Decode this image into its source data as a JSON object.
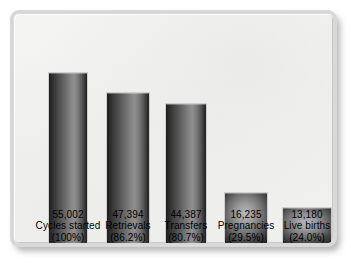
{
  "chart": {
    "type": "bar",
    "title": "",
    "subtitle": "",
    "xlabel": "",
    "ylabel": "",
    "legend": "none",
    "grid": false,
    "axis_visible": false,
    "ylim": [
      0,
      55002
    ],
    "categories": [
      "Cycles started",
      "Retrievals",
      "Transfers",
      "Pregnancies",
      "Live births"
    ],
    "values": [
      55002,
      47394,
      44387,
      16235,
      13180
    ],
    "percent_labels": [
      "(100%)",
      "(86.2%)",
      "(80.7%)",
      "(29.5%)",
      "(24.0%)"
    ],
    "value_labels": [
      "55,002",
      "47,394",
      "44,387",
      "16,235",
      "13,180"
    ],
    "bars": [
      {
        "name": "cycles-started",
        "value_label": "55,002",
        "category": "Cycles started",
        "percent_label": "(100%)",
        "value": 55002,
        "percent": 100.0,
        "left": 38,
        "width": 40,
        "height": 174
      },
      {
        "name": "retrievals",
        "value_label": "47,394",
        "category": "Retrievals",
        "percent_label": "(86.2%)",
        "value": 47394,
        "percent": 86.2,
        "left": 96,
        "width": 44,
        "height": 154
      },
      {
        "name": "transfers",
        "value_label": "44,387",
        "category": "Transfers",
        "percent_label": "(80.7%)",
        "value": 44387,
        "percent": 80.7,
        "left": 155,
        "width": 42,
        "height": 143
      },
      {
        "name": "pregnancies",
        "value_label": "16,235",
        "category": "Pregnancies",
        "percent_label": "(29.5%)",
        "value": 16235,
        "percent": 29.5,
        "left": 214,
        "width": 44,
        "height": 54
      },
      {
        "name": "live-births",
        "value_label": "13,180",
        "category": "Live births",
        "percent_label": "(24.0%)",
        "value": 13180,
        "percent": 24.0,
        "left": 272,
        "width": 50,
        "height": 39
      }
    ],
    "colors": {
      "background": "#f2f2f0",
      "frame_border": "#d8d8d6",
      "bar_dark": "#1d1d1d",
      "bar_light": "#8f8f8f",
      "text": "#000000"
    }
  }
}
